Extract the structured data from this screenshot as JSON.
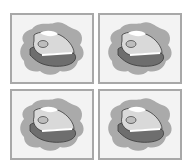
{
  "figure": {
    "layout": "2x2 grid",
    "panels": [
      {
        "subject": "steam-iron clipart",
        "background": "gray splash"
      },
      {
        "subject": "steam-iron clipart",
        "background": "gray splash"
      },
      {
        "subject": "steam-iron clipart",
        "background": "gray splash"
      },
      {
        "subject": "steam-iron clipart",
        "background": "gray splash"
      }
    ],
    "colors": {
      "frame": "#a8a8a8",
      "panel_bg": "#f3f3f3",
      "splash": "#aaaaaa",
      "base_dark": "#6e6e6e",
      "body_light": "#d9d9d9",
      "highlight": "#ffffff",
      "outline": "#3a3a3a"
    }
  }
}
